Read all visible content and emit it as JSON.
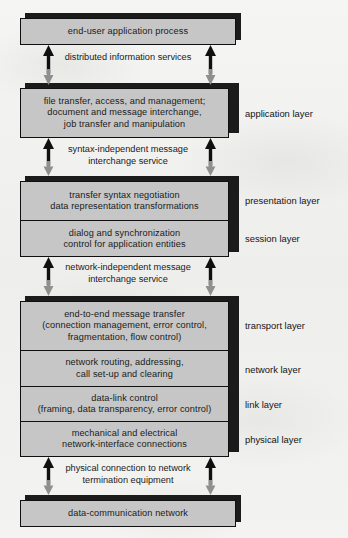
{
  "diagram": {
    "colors": {
      "box_fill": "#c6c6c6",
      "box_border": "#101010",
      "shadow": "#1b1b1b",
      "arrow_up": "#101010",
      "arrow_down": "#8f8f8f",
      "paper": "#f2f2f0"
    }
  },
  "boxes": {
    "top": {
      "text": "end-user application process"
    },
    "application": {
      "line1": "file transfer, access, and management;",
      "line2": "document and message interchange,",
      "line3": "job transfer and manipulation"
    },
    "presentation": {
      "line1": "transfer syntax negotiation",
      "line2": "data representation transformations"
    },
    "session": {
      "line1": "dialog and synchronization",
      "line2": "control for application entities"
    },
    "transport": {
      "line1": "end-to-end message transfer",
      "line2": "(connection management, error control,",
      "line3": "fragmentation, flow control)"
    },
    "network": {
      "line1": "network routing, addressing,",
      "line2": "call set-up and clearing"
    },
    "link": {
      "line1": "data-link control",
      "line2": "(framing, data transparency, error control)"
    },
    "physical": {
      "line1": "mechanical and electrical",
      "line2": "network-interface connections"
    },
    "bottom": {
      "text": "data-communication network"
    }
  },
  "connectors": [
    {
      "id": "distributed-information-services",
      "line1": "distributed information",
      "line2": "services"
    },
    {
      "id": "syntax-independent-message-interchange-service",
      "line1": "syntax-independent message",
      "line2": "interchange service"
    },
    {
      "id": "network-independent-message-interchange-service",
      "line1": "network-independent",
      "line2": "message interchange service"
    },
    {
      "id": "physical-connection-to-network-termination-equipment",
      "line1": "physical connection to",
      "line2": "network termination equipment"
    }
  ],
  "layer_labels": [
    {
      "id": "application",
      "label": "application layer"
    },
    {
      "id": "presentation",
      "label": "presentation layer"
    },
    {
      "id": "session",
      "label": "session layer"
    },
    {
      "id": "transport",
      "label": "transport layer"
    },
    {
      "id": "network",
      "label": "network layer"
    },
    {
      "id": "link",
      "label": "link layer"
    },
    {
      "id": "physical",
      "label": "physical layer"
    }
  ]
}
